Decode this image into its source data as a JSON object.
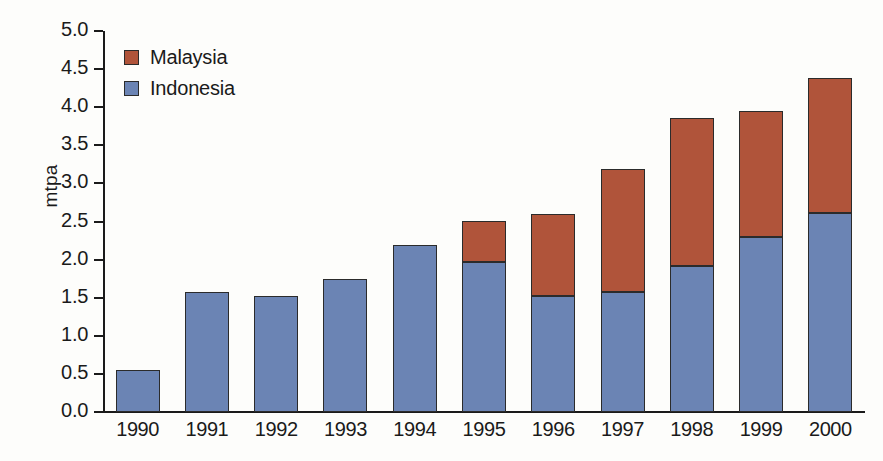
{
  "chart_data": {
    "type": "bar",
    "subtype": "stacked-vertical",
    "title": "",
    "subtitle": "",
    "xlabel": "",
    "ylabel": "mtpa",
    "categories": [
      "1990",
      "1991",
      "1992",
      "1993",
      "1994",
      "1995",
      "1996",
      "1997",
      "1998",
      "1999",
      "2000"
    ],
    "series": [
      {
        "name": "Indonesia",
        "color": "#6b84b4",
        "stack_order": 0,
        "values": [
          0.55,
          1.57,
          1.52,
          1.75,
          2.19,
          1.97,
          1.52,
          1.58,
          1.91,
          2.3,
          2.61
        ]
      },
      {
        "name": "Malaysia",
        "color": "#b0543a",
        "stack_order": 1,
        "values": [
          0.0,
          0.0,
          0.0,
          0.0,
          0.0,
          0.54,
          1.08,
          1.61,
          1.95,
          1.65,
          1.78
        ]
      }
    ],
    "totals": [
      0.55,
      1.57,
      1.52,
      1.75,
      2.19,
      2.51,
      2.6,
      3.19,
      3.86,
      3.95,
      4.39
    ],
    "ylim": [
      0.0,
      5.0
    ],
    "ytick_step": 0.5,
    "ytick_labels": [
      "0.0",
      "0.5",
      "1.0",
      "1.5",
      "2.0",
      "2.5",
      "3.0",
      "3.5",
      "4.0",
      "4.5",
      "5.0"
    ],
    "grid": false,
    "legend_position": "top-left-inside",
    "legend_order": [
      "Malaysia",
      "Indonesia"
    ],
    "annotations": []
  },
  "colors": {
    "malaysia": "#b0543a",
    "indonesia": "#6b84b4",
    "axis": "#1a1a1a",
    "bar_outline": "#2b2b2b",
    "background": "#fdfdfb"
  },
  "legend": {
    "items": [
      {
        "label": "Malaysia",
        "color": "#b0543a",
        "swatch": "legend-swatch-malaysia"
      },
      {
        "label": "Indonesia",
        "color": "#6b84b4",
        "swatch": "legend-swatch-indonesia"
      }
    ]
  },
  "axes": {
    "y": {
      "title": "mtpa",
      "ticks": [
        "5.0",
        "4.5",
        "4.0",
        "3.5",
        "3.0",
        "2.5",
        "2.0",
        "1.5",
        "1.0",
        "0.5",
        "0.0"
      ]
    },
    "x": {
      "ticks": [
        "1990",
        "1991",
        "1992",
        "1993",
        "1994",
        "1995",
        "1996",
        "1997",
        "1998",
        "1999",
        "2000"
      ]
    }
  }
}
